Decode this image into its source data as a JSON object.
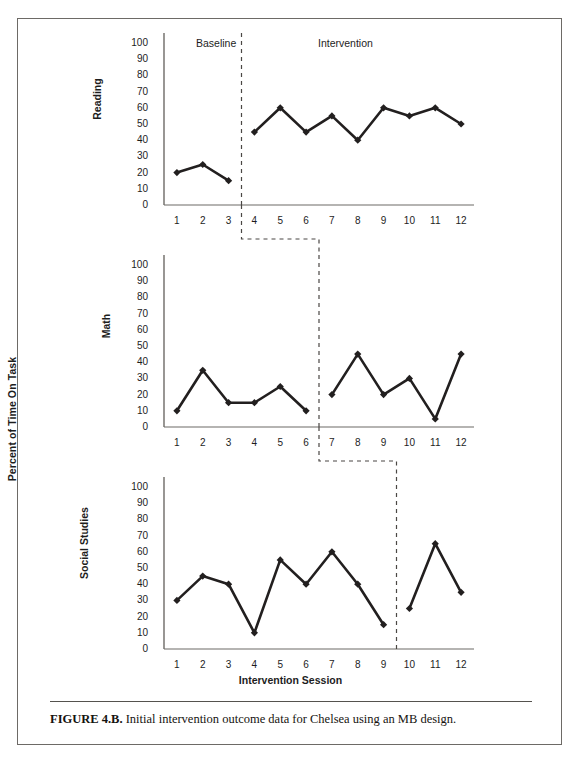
{
  "page": {
    "bleed_text": "",
    "caption_prefix": "FIGURE 4.B.",
    "caption_text": "Initial intervention outcome data for Chelsea using an MB design."
  },
  "axis": {
    "y_title": "Percent of Time On Task",
    "x_title": "Intervention Session"
  },
  "phases": {
    "baseline_label": "Baseline",
    "intervention_label": "Intervention"
  },
  "colors": {
    "line": "#221f1f",
    "marker": "#221f1f",
    "axis": "#6d6a66",
    "phase_line": "#4a4744",
    "border": "#6d6a66",
    "text": "#1d1d1d"
  },
  "chart_data": [
    {
      "type": "line",
      "title": "Reading",
      "xlabel": "Intervention Session",
      "ylabel": "Percent of Time On Task",
      "ylim": [
        0,
        100
      ],
      "yticks": [
        100,
        90,
        80,
        70,
        60,
        50,
        40,
        30,
        20,
        10,
        0
      ],
      "categories": [
        1,
        2,
        3,
        4,
        5,
        6,
        7,
        8,
        9,
        10,
        11,
        12
      ],
      "values": [
        20,
        25,
        15,
        45,
        60,
        45,
        55,
        40,
        60,
        55,
        60,
        50
      ],
      "phase_change_after": 3,
      "phases": [
        {
          "name": "Baseline",
          "sessions": [
            1,
            2,
            3
          ],
          "values": [
            20,
            25,
            15
          ]
        },
        {
          "name": "Intervention",
          "sessions": [
            4,
            5,
            6,
            7,
            8,
            9,
            10,
            11,
            12
          ],
          "values": [
            45,
            60,
            45,
            55,
            40,
            60,
            55,
            60,
            50
          ]
        }
      ],
      "grid": false,
      "legend": "none"
    },
    {
      "type": "line",
      "title": "Math",
      "xlabel": "Intervention Session",
      "ylabel": "Percent of Time On Task",
      "ylim": [
        0,
        100
      ],
      "yticks": [
        100,
        90,
        80,
        70,
        60,
        50,
        40,
        30,
        20,
        10,
        0
      ],
      "categories": [
        1,
        2,
        3,
        4,
        5,
        6,
        7,
        8,
        9,
        10,
        11,
        12
      ],
      "values": [
        10,
        35,
        15,
        15,
        25,
        10,
        20,
        45,
        20,
        30,
        5,
        45
      ],
      "phase_change_after": 6,
      "phases": [
        {
          "name": "Baseline",
          "sessions": [
            1,
            2,
            3,
            4,
            5,
            6
          ],
          "values": [
            10,
            35,
            15,
            15,
            25,
            10
          ]
        },
        {
          "name": "Intervention",
          "sessions": [
            7,
            8,
            9,
            10,
            11,
            12
          ],
          "values": [
            20,
            45,
            20,
            30,
            5,
            45
          ]
        }
      ],
      "grid": false,
      "legend": "none"
    },
    {
      "type": "line",
      "title": "Social Studies",
      "xlabel": "Intervention Session",
      "ylabel": "Percent of Time On Task",
      "ylim": [
        0,
        100
      ],
      "yticks": [
        100,
        90,
        80,
        70,
        60,
        50,
        40,
        30,
        20,
        10,
        0
      ],
      "categories": [
        1,
        2,
        3,
        4,
        5,
        6,
        7,
        8,
        9,
        10,
        11,
        12
      ],
      "values": [
        30,
        45,
        40,
        10,
        55,
        40,
        60,
        40,
        15,
        25,
        65,
        35
      ],
      "phase_change_after": 9,
      "phases": [
        {
          "name": "Baseline",
          "sessions": [
            1,
            2,
            3,
            4,
            5,
            6,
            7,
            8,
            9
          ],
          "values": [
            30,
            45,
            40,
            10,
            55,
            40,
            60,
            40,
            15
          ]
        },
        {
          "name": "Intervention",
          "sessions": [
            10,
            11,
            12
          ],
          "values": [
            25,
            65,
            35
          ]
        }
      ],
      "grid": false,
      "legend": "none"
    }
  ]
}
